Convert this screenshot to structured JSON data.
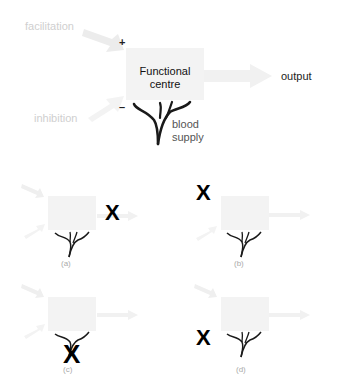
{
  "main_diagram": {
    "facilitation_label": "facilitation",
    "inhibition_label": "inhibition",
    "plus_sign": "+",
    "minus_sign": "–",
    "centre_label_line1": "Functional",
    "centre_label_line2": "centre",
    "output_label": "output",
    "blood_label_line1": "blood",
    "blood_label_line2": "supply"
  },
  "panels": [
    {
      "label": "(a)",
      "crossed": "output",
      "cross_glyph": "X"
    },
    {
      "label": "(b)",
      "crossed": "facilitation",
      "cross_glyph": "X"
    },
    {
      "label": "(c)",
      "crossed": "blood supply",
      "cross_glyph": "X"
    },
    {
      "label": "(d)",
      "crossed": "inhibition",
      "cross_glyph": "X"
    }
  ],
  "colors": {
    "box": "#f3f3f3",
    "faint_arrow": "#ececec",
    "vessel": "#1a1a1a",
    "cross": "#000000"
  }
}
